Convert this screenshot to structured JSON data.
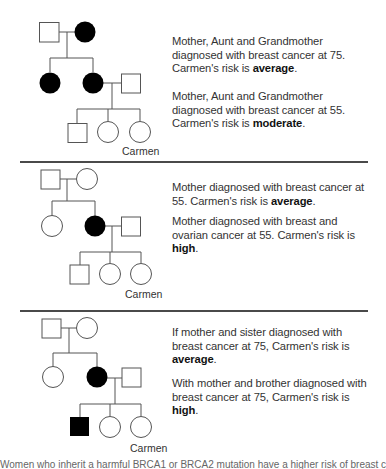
{
  "figure": {
    "proband_label": "Carmen",
    "colors": {
      "affected": "#000000",
      "unaffected": "#ffffff",
      "line": "#555555",
      "divider": "#4a4a4a"
    }
  },
  "panels": [
    {
      "id": "panel-1",
      "pedigree": {
        "generation1": [
          {
            "role": "grandfather",
            "sex": "male",
            "affected": false
          },
          {
            "role": "grandmother",
            "sex": "female",
            "affected": true
          }
        ],
        "generation2": [
          {
            "role": "aunt",
            "sex": "female",
            "affected": true
          },
          {
            "role": "mother",
            "sex": "female",
            "affected": true
          },
          {
            "role": "father",
            "sex": "male",
            "affected": false
          }
        ],
        "generation3": [
          {
            "role": "brother",
            "sex": "male",
            "affected": false
          },
          {
            "role": "sister",
            "sex": "female",
            "affected": false
          },
          {
            "role": "carmen",
            "sex": "female",
            "affected": false
          }
        ]
      },
      "label": "Carmen",
      "scenarios": [
        {
          "text": "Mother, Aunt and Grandmother diagnosed with breast cancer at 75. Carmen's risk is ",
          "risk": "average",
          "end": "."
        },
        {
          "text": "Mother, Aunt and Grandmother diagnosed with breast cancer at 55. Carmen's risk is ",
          "risk": "moderate",
          "end": "."
        }
      ]
    },
    {
      "id": "panel-2",
      "pedigree": {
        "generation1": [
          {
            "role": "grandfather",
            "sex": "male",
            "affected": false
          },
          {
            "role": "grandmother",
            "sex": "female",
            "affected": false
          }
        ],
        "generation2": [
          {
            "role": "aunt",
            "sex": "female",
            "affected": false
          },
          {
            "role": "mother",
            "sex": "female",
            "affected": true
          },
          {
            "role": "father",
            "sex": "male",
            "affected": false
          }
        ],
        "generation3": [
          {
            "role": "brother",
            "sex": "male",
            "affected": false
          },
          {
            "role": "sister",
            "sex": "female",
            "affected": false
          },
          {
            "role": "carmen",
            "sex": "female",
            "affected": false
          }
        ]
      },
      "label": "Carmen",
      "scenarios": [
        {
          "text": "Mother diagnosed with breast cancer at 55. Carmen's risk is ",
          "risk": "average",
          "end": "."
        },
        {
          "text": "Mother diagnosed with breast and ovarian cancer at 55. Carmen's risk is ",
          "risk": "high",
          "end": "."
        }
      ]
    },
    {
      "id": "panel-3",
      "pedigree": {
        "generation1": [
          {
            "role": "grandfather",
            "sex": "male",
            "affected": false
          },
          {
            "role": "grandmother",
            "sex": "female",
            "affected": false
          }
        ],
        "generation2": [
          {
            "role": "aunt",
            "sex": "female",
            "affected": false
          },
          {
            "role": "mother",
            "sex": "female",
            "affected": true
          },
          {
            "role": "father",
            "sex": "male",
            "affected": false
          }
        ],
        "generation3": [
          {
            "role": "brother",
            "sex": "male",
            "affected": true
          },
          {
            "role": "sister",
            "sex": "female",
            "affected": false
          },
          {
            "role": "carmen",
            "sex": "female",
            "affected": false
          }
        ]
      },
      "label": "Carmen",
      "scenarios": [
        {
          "text": "If mother and sister diagnosed with breast cancer at 75, Carmen's risk is ",
          "risk": "average",
          "end": "."
        },
        {
          "text": "With mother and brother diagnosed with breast cancer at 75, Carmen's risk is ",
          "risk": "high",
          "end": "."
        }
      ]
    }
  ],
  "footer": {
    "text": "Women who inherit a harmful BRCA1 or BRCA2 mutation have a higher risk of breast cancer"
  }
}
